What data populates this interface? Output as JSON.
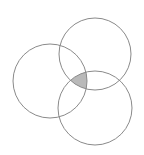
{
  "diagram": {
    "type": "venn",
    "background": "#ffffff",
    "stroke_color": "#8a8a8a",
    "fill_color": "#b9b9b9",
    "circles": [
      {
        "name": "left",
        "cx": 50,
        "cy": 81,
        "r": 37
      },
      {
        "name": "top",
        "cx": 95,
        "cy": 54,
        "r": 36
      },
      {
        "name": "bottom",
        "cx": 95,
        "cy": 108,
        "r": 37
      }
    ],
    "shaded_region": "intersection of all three circles"
  }
}
